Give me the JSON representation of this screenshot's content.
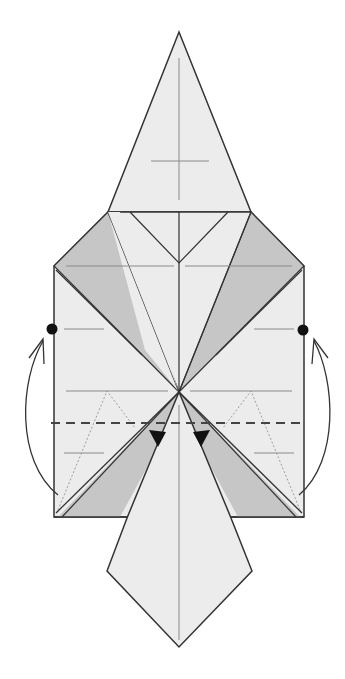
{
  "diagram": {
    "kind": "origami-fold-step",
    "caption": "Fold the bottom edge up so the bottom corners meet the marked dots; reverse-fold the inner flaps at the arrows.",
    "colors": {
      "paper": "#ececec",
      "paper_shaded": "#c6c6c6",
      "line": "#333333",
      "crease": "#8a8a8a",
      "background": "#ffffff"
    },
    "symbols": [
      {
        "name": "reference-dot-left",
        "type": "dot"
      },
      {
        "name": "reference-dot-right",
        "type": "dot"
      },
      {
        "name": "valley-fold-line",
        "type": "dashed-line"
      },
      {
        "name": "fold-up-arrow-left",
        "type": "curved-arrow"
      },
      {
        "name": "fold-up-arrow-right",
        "type": "curved-arrow"
      },
      {
        "name": "push-arrow-left",
        "type": "filled-arrowhead"
      },
      {
        "name": "push-arrow-right",
        "type": "filled-arrowhead"
      }
    ]
  }
}
